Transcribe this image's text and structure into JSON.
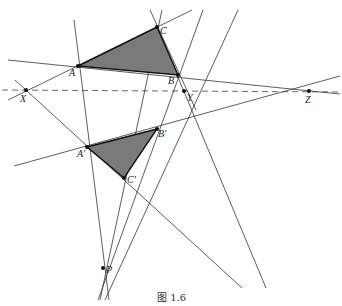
{
  "figure": {
    "caption": "图 1.6"
  },
  "points": {
    "A": {
      "label": "A",
      "x": 78,
      "y": 66
    },
    "B": {
      "label": "B",
      "x": 178,
      "y": 75
    },
    "C": {
      "label": "C",
      "x": 157,
      "y": 27
    },
    "A2": {
      "label": "A'",
      "x": 87,
      "y": 147
    },
    "B2": {
      "label": "B'",
      "x": 157,
      "y": 129
    },
    "C2": {
      "label": "C'",
      "x": 124,
      "y": 178
    },
    "X": {
      "label": "X",
      "x": 26,
      "y": 90
    },
    "Y": {
      "label": "Y",
      "x": 184,
      "y": 91
    },
    "Z": {
      "label": "Z",
      "x": 309,
      "y": 91
    },
    "P": {
      "label": "P",
      "x": 103,
      "y": 268
    }
  },
  "triangles": [
    {
      "name": "ABC",
      "fill": "#7a7a7a"
    },
    {
      "name": "A'B'C'",
      "fill": "#7a7a7a"
    }
  ],
  "axis_line": {
    "name": "XYZ",
    "style": "dashed"
  }
}
